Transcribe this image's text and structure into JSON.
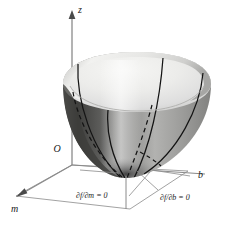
{
  "figure": {
    "kind": "3d-surface-diagram",
    "background_color": "#ffffff"
  },
  "axes": {
    "vertical": {
      "name": "z-axis",
      "label": "z",
      "arrow": "up",
      "color": "#8a8a8a"
    },
    "right": {
      "name": "b-axis",
      "label": "b",
      "arrow": "none",
      "color": "#8a8a8a"
    },
    "left": {
      "name": "m-axis",
      "label": "m",
      "arrow": "down-left",
      "color": "#8a8a8a"
    },
    "origin": {
      "name": "origin",
      "label": "O",
      "color": "#1a1a1a"
    }
  },
  "annotations": [
    {
      "id": "partial-m",
      "label": "∂f/∂m = 0",
      "leader": true
    },
    {
      "id": "partial-b",
      "label": "∂f/∂b = 0",
      "leader": true
    }
  ],
  "surface": {
    "name": "paraboloid-bowl",
    "shading": {
      "interior_light": "#ededeb",
      "interior_mid": "#dcdcda",
      "exterior_left_dark": "#4a4a4a",
      "exterior_right_mid": "#9a9a98",
      "rim_highlight": "#f4f4f2",
      "vertex_dark": "#3d3d3d"
    },
    "curves": {
      "solid_color": "#1a1a1a",
      "dashed_color": "#1a1a1a",
      "solid_count": 4,
      "dashed_count": 2
    }
  },
  "floor": {
    "name": "base-plane",
    "color": "#8a8a8a",
    "shape": "parallelogram"
  },
  "drop_line": {
    "name": "vertex-drop-line",
    "color": "#8a8a8a"
  }
}
